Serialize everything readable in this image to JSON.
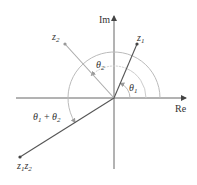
{
  "diagram": {
    "type": "complex-plane-multiplication",
    "axes": {
      "real_label": "Re",
      "imag_label": "Im"
    },
    "points": {
      "z1": {
        "label_main": "z",
        "label_sub": "1",
        "angle_deg": 67
      },
      "z2": {
        "label_main": "z",
        "label_sub": "2",
        "angle_deg": 135
      },
      "z1z2": {
        "label_main1": "z",
        "label_sub1": "1",
        "label_main2": "z",
        "label_sub2": "2",
        "angle_deg": 212
      }
    },
    "angles": {
      "theta1": {
        "symbol": "θ",
        "sub": "1"
      },
      "theta2": {
        "symbol": "θ",
        "sub": "2"
      },
      "theta_sum": {
        "symbol1": "θ",
        "sub1": "1",
        "plus": " + ",
        "symbol2": "θ",
        "sub2": "2"
      }
    },
    "colors": {
      "axis": "#555555",
      "vector_dark": "#555555",
      "vector_light": "#aaaaaa",
      "arc": "#bbbbbb"
    }
  }
}
